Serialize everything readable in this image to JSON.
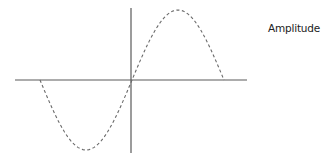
{
  "diagram": {
    "type": "sine-wave",
    "label": "Amplitude",
    "colors": {
      "axis": "#5a5a5a",
      "curve": "#6a6a6a",
      "text": "#222222",
      "background": "#ffffff"
    },
    "axes": {
      "horizontal": {
        "x1": 15,
        "x2": 247,
        "y": 80
      },
      "vertical": {
        "x": 131,
        "y1": 8,
        "y2": 153
      }
    },
    "curve": {
      "style": "dashed",
      "start_x": 40,
      "end_x": 224,
      "baseline_y": 80,
      "amplitude_px": 70,
      "period_px": 184,
      "phase": "starts at zero going negative (inverted sine from left), crosses origin upward"
    }
  }
}
